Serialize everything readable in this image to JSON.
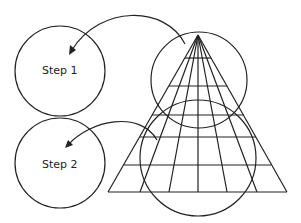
{
  "diagram": {
    "step1_label": "Step 1",
    "step2_label": "Step 2",
    "stroke_color": "#222222",
    "background": "#ffffff"
  }
}
